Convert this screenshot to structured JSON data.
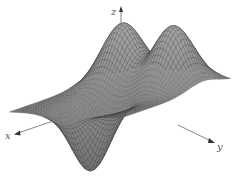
{
  "chart_data": {
    "type": "surface3d",
    "title": "",
    "axes": {
      "x": {
        "label": "x"
      },
      "y": {
        "label": "y"
      },
      "z": {
        "label": "z"
      }
    },
    "grid": false,
    "legend": null,
    "domain": {
      "x": [
        -2,
        2
      ],
      "y": [
        -2,
        2
      ]
    },
    "mesh_resolution": 44,
    "features": [
      {
        "kind": "peak",
        "x": -1.0,
        "y": -0.9,
        "height": 1.0,
        "width": 0.55
      },
      {
        "kind": "peak",
        "x": -1.0,
        "y": 0.9,
        "height": 1.0,
        "width": 0.55
      },
      {
        "kind": "trough",
        "x": 1.05,
        "y": 0.0,
        "height": -1.05,
        "width": 0.5
      }
    ],
    "colors": {
      "surface_fill": "#8a8a8a",
      "wire": "#2e2e2e",
      "axis": "#6a6a6a",
      "background": "#ffffff"
    }
  }
}
